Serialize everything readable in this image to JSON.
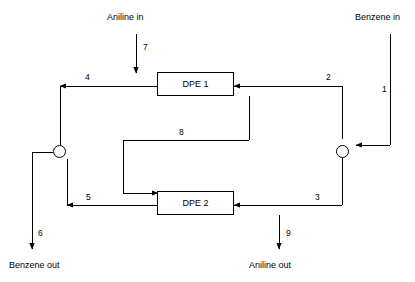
{
  "diagram": {
    "units": [
      {
        "id": "dpe1",
        "label": "DPE 1"
      },
      {
        "id": "dpe2",
        "label": "DPE 2"
      }
    ],
    "io_labels": [
      {
        "id": "aniline-in",
        "text": "Aniline in"
      },
      {
        "id": "benzene-in",
        "text": "Benzene in"
      },
      {
        "id": "benzene-out",
        "text": "Benzene out"
      },
      {
        "id": "aniline-out",
        "text": "Aniline out"
      }
    ],
    "stream_numbers": [
      {
        "id": "stream-1",
        "text": "1"
      },
      {
        "id": "stream-2",
        "text": "2"
      },
      {
        "id": "stream-3",
        "text": "3"
      },
      {
        "id": "stream-4",
        "text": "4"
      },
      {
        "id": "stream-5",
        "text": "5"
      },
      {
        "id": "stream-6",
        "text": "6"
      },
      {
        "id": "stream-7",
        "text": "7"
      },
      {
        "id": "stream-8",
        "text": "8"
      },
      {
        "id": "stream-9",
        "text": "9"
      }
    ],
    "colors": {
      "line": "#000000",
      "background": "#ffffff"
    }
  }
}
